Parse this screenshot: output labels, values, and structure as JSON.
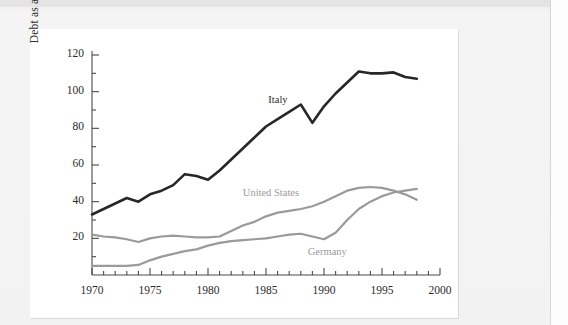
{
  "chart_data": {
    "type": "line",
    "title": "",
    "subtitle": "",
    "xlabel": "",
    "ylabel": "Debt as a percent of GDP",
    "xlim": [
      1970,
      2000
    ],
    "ylim": [
      0,
      120
    ],
    "grid": false,
    "legend_position": "inline-annotations",
    "x_major_ticks": [
      1970,
      1975,
      1980,
      1985,
      1990,
      1995,
      2000
    ],
    "x_major_tick_labels": [
      "1970",
      "1975",
      "1980",
      "1985",
      "1990",
      "1995",
      "2000"
    ],
    "x_minor_tick_interval": 1,
    "y_major_ticks": [
      20,
      40,
      60,
      80,
      100,
      120
    ],
    "y_major_tick_labels": [
      "20",
      "40",
      "60",
      "80",
      "100",
      "120"
    ],
    "y_minor_tick_interval": 10,
    "x": [
      1970,
      1971,
      1972,
      1973,
      1974,
      1975,
      1976,
      1977,
      1978,
      1979,
      1980,
      1981,
      1982,
      1983,
      1984,
      1985,
      1986,
      1987,
      1988,
      1989,
      1990,
      1991,
      1992,
      1993,
      1994,
      1995,
      1996,
      1997,
      1998
    ],
    "series": [
      {
        "name": "Italy",
        "color": "#272727",
        "label_x": 1985.2,
        "label_y": 95,
        "values": [
          33,
          36,
          39,
          42,
          40,
          44,
          46,
          49,
          55,
          54,
          52,
          57,
          63,
          69,
          75,
          81,
          85,
          89,
          93,
          83,
          92,
          99,
          105,
          111,
          110,
          110,
          110.5,
          108,
          107
        ]
      },
      {
        "name": "United States",
        "color": "#9a9a9a",
        "label_x": 1983.0,
        "label_y": 44,
        "values": [
          22,
          21,
          20.5,
          19.5,
          18,
          20,
          21,
          21.5,
          21,
          20.5,
          20.5,
          21,
          24,
          27,
          29,
          32,
          34,
          35,
          36,
          37.5,
          40,
          43,
          46,
          47.5,
          48,
          47.5,
          46,
          44,
          41
        ]
      },
      {
        "name": "Germany",
        "color": "#9a9a9a",
        "label_x": 1988.6,
        "label_y": 12,
        "values": [
          5,
          5,
          5,
          5,
          5.5,
          8,
          10,
          11.5,
          13,
          14,
          16,
          17.5,
          18.5,
          19,
          19.5,
          20,
          21,
          22,
          22.5,
          21,
          19.5,
          23,
          30,
          36,
          40,
          43,
          45,
          46,
          47
        ]
      }
    ]
  }
}
